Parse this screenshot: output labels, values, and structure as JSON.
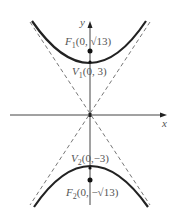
{
  "diagram": {
    "type": "hyperbola",
    "equation_implied": "y^2/9 - x^2/4 = 1",
    "axes": {
      "x_label": "x",
      "y_label": "y"
    },
    "points": {
      "F1": {
        "label": "F",
        "sub": "1",
        "coords": "(0, √13)"
      },
      "V1": {
        "label": "V",
        "sub": "1",
        "coords": "(0, 3)"
      },
      "V2": {
        "label": "V",
        "sub": "2",
        "coords": "(0,−3)"
      },
      "F2": {
        "label": "F",
        "sub": "2",
        "coords": "(0, −√13)"
      }
    },
    "asymptotes": "dashed lines through origin",
    "colors": {
      "curve": "#222222",
      "axes": "#444444",
      "asymptote": "#666666",
      "text": "#555555"
    }
  }
}
